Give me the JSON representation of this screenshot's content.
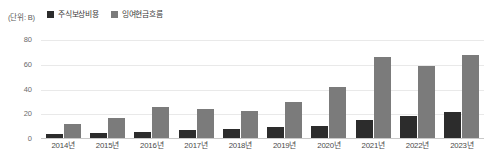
{
  "chart_data": {
    "type": "bar",
    "title": "",
    "subtitle": "",
    "unit_note": "(단위: B)",
    "xlabel": "",
    "ylabel": "",
    "ylim": [
      0,
      80
    ],
    "yticks": [
      80,
      60,
      40,
      20,
      0
    ],
    "grid": true,
    "legend_position": "top-left",
    "categories": [
      "2014년",
      "2015년",
      "2016년",
      "2017년",
      "2018년",
      "2019년",
      "2020년",
      "2021년",
      "2022년",
      "2023년"
    ],
    "series": [
      {
        "name": "주식보상비용",
        "color": "#2c2c2c",
        "values": [
          4,
          5,
          6,
          7,
          8,
          9.5,
          10.5,
          15,
          19,
          22
        ]
      },
      {
        "name": "잉여현금흐름",
        "color": "#7b7b7b",
        "values": [
          12,
          17,
          26,
          24,
          23,
          30,
          42,
          66,
          59,
          68
        ]
      }
    ]
  }
}
